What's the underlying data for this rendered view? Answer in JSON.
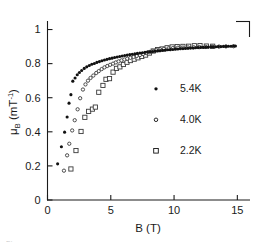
{
  "figure": {
    "background": "#ffffff",
    "ink": "#1a1a1a",
    "caption_fragment": "Figure"
  },
  "chart_data": {
    "type": "scatter",
    "title": "",
    "subtitle": "",
    "xlabel": "B  (T)",
    "ylabel": "μB  (mT⁻¹)",
    "ylabel_parts": {
      "symbol": "μ",
      "subscript": "B",
      "units_open": " (mT",
      "units_exponent": "-1",
      "units_close": ")"
    },
    "xlim": [
      0,
      16
    ],
    "ylim": [
      0,
      1.05
    ],
    "xticks": [
      0,
      5,
      10,
      15
    ],
    "xtick_labels": [
      "0",
      "5",
      "10",
      "15"
    ],
    "yticks": [
      0,
      0.2,
      0.4,
      0.6,
      0.8,
      1
    ],
    "ytick_labels": [
      "0",
      "0.2",
      "0.4",
      "0.6",
      "0.8",
      "1"
    ],
    "grid": false,
    "legend_position": "center-right",
    "axis_style": "left-and-bottom-spines-with-inward-ticks",
    "series": [
      {
        "name": "5.4K",
        "label": "5.4K",
        "marker": "filled-circle",
        "marker_size": 3.0,
        "color": "#111111",
        "fill": "#111111",
        "points": [
          [
            0.8,
            0.212
          ],
          [
            1.1,
            0.312
          ],
          [
            1.35,
            0.398
          ],
          [
            1.55,
            0.487
          ],
          [
            1.7,
            0.568
          ],
          [
            1.85,
            0.618
          ],
          [
            2.0,
            0.697
          ],
          [
            2.18,
            0.716
          ],
          [
            2.35,
            0.735
          ],
          [
            2.52,
            0.748
          ],
          [
            2.7,
            0.76
          ],
          [
            2.9,
            0.772
          ],
          [
            3.1,
            0.781
          ],
          [
            3.3,
            0.789
          ],
          [
            3.5,
            0.796
          ],
          [
            3.7,
            0.801
          ],
          [
            3.9,
            0.807
          ],
          [
            4.1,
            0.812
          ],
          [
            4.3,
            0.817
          ],
          [
            4.5,
            0.821
          ],
          [
            4.7,
            0.825
          ],
          [
            4.9,
            0.829
          ],
          [
            5.1,
            0.832
          ],
          [
            5.3,
            0.836
          ],
          [
            5.5,
            0.839
          ],
          [
            5.7,
            0.842
          ],
          [
            5.9,
            0.845
          ],
          [
            6.1,
            0.848
          ],
          [
            6.3,
            0.85
          ],
          [
            6.5,
            0.853
          ],
          [
            6.7,
            0.855
          ],
          [
            6.9,
            0.857
          ],
          [
            7.1,
            0.86
          ],
          [
            7.3,
            0.862
          ],
          [
            7.5,
            0.864
          ],
          [
            7.7,
            0.866
          ],
          [
            7.9,
            0.868
          ],
          [
            8.1,
            0.87
          ],
          [
            8.3,
            0.871
          ],
          [
            8.5,
            0.873
          ],
          [
            8.7,
            0.875
          ],
          [
            8.9,
            0.876
          ],
          [
            9.1,
            0.878
          ],
          [
            9.3,
            0.879
          ],
          [
            9.5,
            0.881
          ],
          [
            9.7,
            0.882
          ],
          [
            9.9,
            0.883
          ],
          [
            10.1,
            0.885
          ],
          [
            10.3,
            0.886
          ],
          [
            10.5,
            0.887
          ],
          [
            10.7,
            0.888
          ],
          [
            10.9,
            0.889
          ],
          [
            11.1,
            0.89
          ],
          [
            11.3,
            0.891
          ],
          [
            11.5,
            0.892
          ],
          [
            11.7,
            0.893
          ],
          [
            11.9,
            0.894
          ],
          [
            12.1,
            0.895
          ],
          [
            12.3,
            0.895
          ],
          [
            12.5,
            0.896
          ],
          [
            12.7,
            0.897
          ],
          [
            12.9,
            0.898
          ],
          [
            13.1,
            0.898
          ],
          [
            13.3,
            0.899
          ],
          [
            13.5,
            0.9
          ],
          [
            13.7,
            0.9
          ],
          [
            13.9,
            0.901
          ],
          [
            14.1,
            0.901
          ],
          [
            14.3,
            0.902
          ],
          [
            14.5,
            0.902
          ],
          [
            14.7,
            0.903
          ],
          [
            14.85,
            0.903
          ]
        ]
      },
      {
        "name": "4.0K",
        "label": "4.0K",
        "marker": "open-circle",
        "marker_size": 3.0,
        "color": "#3a3a3a",
        "fill": "none",
        "points": [
          [
            1.3,
            0.172
          ],
          [
            1.55,
            0.262
          ],
          [
            1.72,
            0.33
          ],
          [
            1.95,
            0.408
          ],
          [
            2.15,
            0.468
          ],
          [
            2.38,
            0.532
          ],
          [
            2.58,
            0.597
          ],
          [
            2.8,
            0.648
          ],
          [
            3.0,
            0.678
          ],
          [
            3.2,
            0.7
          ],
          [
            3.4,
            0.716
          ],
          [
            3.62,
            0.73
          ],
          [
            3.85,
            0.745
          ],
          [
            4.05,
            0.756
          ],
          [
            4.28,
            0.768
          ],
          [
            4.5,
            0.778
          ],
          [
            4.72,
            0.786
          ],
          [
            4.95,
            0.793
          ],
          [
            5.18,
            0.8
          ],
          [
            5.4,
            0.807
          ],
          [
            5.62,
            0.813
          ],
          [
            5.85,
            0.819
          ],
          [
            6.08,
            0.824
          ],
          [
            6.3,
            0.829
          ],
          [
            6.55,
            0.834
          ],
          [
            6.8,
            0.839
          ],
          [
            7.05,
            0.845
          ],
          [
            7.3,
            0.85
          ],
          [
            7.55,
            0.856
          ],
          [
            7.8,
            0.862
          ],
          [
            8.05,
            0.868
          ],
          [
            8.3,
            0.874
          ],
          [
            8.6,
            0.88
          ],
          [
            8.9,
            0.884
          ],
          [
            9.2,
            0.887
          ],
          [
            9.55,
            0.889
          ],
          [
            9.9,
            0.891
          ],
          [
            10.3,
            0.893
          ],
          [
            10.7,
            0.894
          ],
          [
            11.1,
            0.895
          ],
          [
            11.55,
            0.896
          ],
          [
            12.0,
            0.897
          ],
          [
            12.5,
            0.898
          ],
          [
            13.0,
            0.899
          ],
          [
            13.55,
            0.9
          ],
          [
            14.1,
            0.901
          ],
          [
            14.7,
            0.902
          ]
        ]
      },
      {
        "name": "2.2K",
        "label": "2.2K",
        "marker": "open-square",
        "marker_size": 4.2,
        "color": "#3a3a3a",
        "fill": "none",
        "points": [
          [
            1.85,
            0.182
          ],
          [
            2.25,
            0.29
          ],
          [
            2.65,
            0.402
          ],
          [
            2.95,
            0.485
          ],
          [
            3.25,
            0.52
          ],
          [
            3.55,
            0.533
          ],
          [
            3.78,
            0.545
          ],
          [
            4.05,
            0.632
          ],
          [
            4.38,
            0.672
          ],
          [
            4.62,
            0.708
          ],
          [
            4.9,
            0.712
          ],
          [
            5.18,
            0.75
          ],
          [
            5.45,
            0.772
          ],
          [
            5.72,
            0.781
          ],
          [
            6.0,
            0.795
          ],
          [
            6.28,
            0.808
          ],
          [
            6.55,
            0.818
          ],
          [
            6.85,
            0.826
          ],
          [
            7.15,
            0.834
          ],
          [
            7.45,
            0.842
          ],
          [
            7.75,
            0.85
          ],
          [
            8.05,
            0.862
          ],
          [
            8.35,
            0.874
          ],
          [
            8.7,
            0.882
          ],
          [
            9.05,
            0.886
          ],
          [
            9.45,
            0.893
          ],
          [
            9.85,
            0.898
          ],
          [
            10.25,
            0.9
          ],
          [
            10.7,
            0.901
          ],
          [
            11.15,
            0.902
          ],
          [
            11.6,
            0.905
          ],
          [
            12.05,
            0.906
          ],
          [
            12.55,
            0.903
          ],
          [
            13.05,
            0.902
          ]
        ]
      }
    ],
    "legend_entries": [
      {
        "label": "5.4K",
        "marker": "filled-circle"
      },
      {
        "label": "4.0K",
        "marker": "open-circle"
      },
      {
        "label": "2.2K",
        "marker": "open-square"
      }
    ]
  }
}
